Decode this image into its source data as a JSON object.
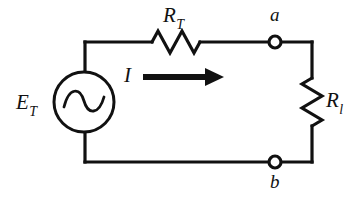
{
  "figure": {
    "kind": "circuit-diagram",
    "background_color": "#ffffff",
    "line_color": "#111111",
    "width": 364,
    "height": 199
  },
  "labels": {
    "source": {
      "base": "E",
      "sub": "T",
      "full": "E_T",
      "role": "ac-voltage-source-label"
    },
    "series_resistor": {
      "base": "R",
      "sub": "T",
      "full": "R_T",
      "role": "series-resistor-label"
    },
    "load_resistor": {
      "base": "R",
      "sub": "l",
      "full": "R_l",
      "role": "load-resistor-label"
    },
    "current": {
      "base": "I",
      "full": "I",
      "role": "current-label"
    },
    "terminal_a": "a",
    "terminal_b": "b"
  },
  "components": [
    {
      "id": "source",
      "type": "ac-voltage-source",
      "label": "E_T",
      "symbol": "circle-with-sine",
      "position": "left-branch"
    },
    {
      "id": "series-resistor",
      "type": "resistor",
      "label": "R_T",
      "symbol": "zigzag",
      "orientation": "horizontal",
      "position": "top-branch"
    },
    {
      "id": "load-resistor",
      "type": "resistor",
      "label": "R_l",
      "symbol": "zigzag",
      "orientation": "vertical",
      "position": "right-branch"
    },
    {
      "id": "terminal-a",
      "type": "terminal-node",
      "label": "a",
      "symbol": "open-circle",
      "position": "top-right"
    },
    {
      "id": "terminal-b",
      "type": "terminal-node",
      "label": "b",
      "symbol": "open-circle",
      "position": "bottom-right"
    },
    {
      "id": "current-arrow",
      "type": "current-direction-arrow",
      "label": "I",
      "direction": "right"
    }
  ],
  "geometry": {
    "loop": {
      "left": 85,
      "right": 312,
      "top": 42,
      "bottom": 162
    },
    "source_circle": {
      "cx": 84,
      "cy": 102,
      "r": 30
    },
    "series_resistor_span": {
      "x1": 152,
      "x2": 202,
      "y": 42
    },
    "load_resistor_span": {
      "x": 312,
      "y1": 78,
      "y2": 126
    },
    "node_a": {
      "cx": 275,
      "cy": 42,
      "r": 6
    },
    "node_b": {
      "cx": 275,
      "cy": 162,
      "r": 6
    },
    "arrow": {
      "x1": 143,
      "x2": 222,
      "y": 77
    }
  }
}
